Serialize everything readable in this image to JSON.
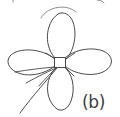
{
  "figure": {
    "panel_label": "(b)",
    "caption_alt": "Four-petal rose curve with square hub at origin",
    "colors": {
      "background": "#ffffff",
      "stroke": "#4a4a4a",
      "stroke_faint": "#8d8d8d",
      "label": "#3d3d3d",
      "hub_fill": "#ffffff"
    },
    "canvas": {
      "width": 120,
      "height": 117
    },
    "center": {
      "x": 60,
      "y": 63
    },
    "hub": {
      "shape": "square",
      "x": 54,
      "y": 57,
      "width": 12,
      "height": 11
    },
    "petals": [
      {
        "name": "petal-top",
        "angle_deg": 90,
        "tip_x": 61,
        "tip_y": 13,
        "half_width": 14,
        "length": 50
      },
      {
        "name": "petal-left",
        "angle_deg": 180,
        "tip_x": 8,
        "tip_y": 62,
        "half_width": 13,
        "length": 52
      },
      {
        "name": "petal-right",
        "angle_deg": 0,
        "tip_x": 112,
        "tip_y": 61,
        "half_width": 13,
        "length": 52
      },
      {
        "name": "petal-bottom",
        "angle_deg": 270,
        "tip_x": 61,
        "tip_y": 110,
        "half_width": 13,
        "length": 47
      }
    ],
    "stem": {
      "name": "stem-curve",
      "start_x": 57,
      "start_y": 68,
      "end_x": 20,
      "end_y": 113
    },
    "spokes": [
      {
        "name": "spoke-lower-left-1",
        "x1": 55,
        "y1": 67,
        "x2": 16,
        "y2": 72
      },
      {
        "name": "spoke-lower-left-2",
        "x1": 56,
        "y1": 68,
        "x2": 25,
        "y2": 82
      },
      {
        "name": "spoke-lower-left-3",
        "x1": 57,
        "y1": 68,
        "x2": 38,
        "y2": 86
      },
      {
        "name": "spoke-upper-left",
        "x1": 55,
        "y1": 59,
        "x2": 44,
        "y2": 52
      },
      {
        "name": "spoke-upper-right",
        "x1": 66,
        "y1": 59,
        "x2": 76,
        "y2": 52
      },
      {
        "name": "spoke-lower-right",
        "x1": 66,
        "y1": 68,
        "x2": 74,
        "y2": 76
      }
    ],
    "top_artifact": {
      "name": "cropped-arc-artifact",
      "description": "partial cropped stroke from content above"
    }
  }
}
